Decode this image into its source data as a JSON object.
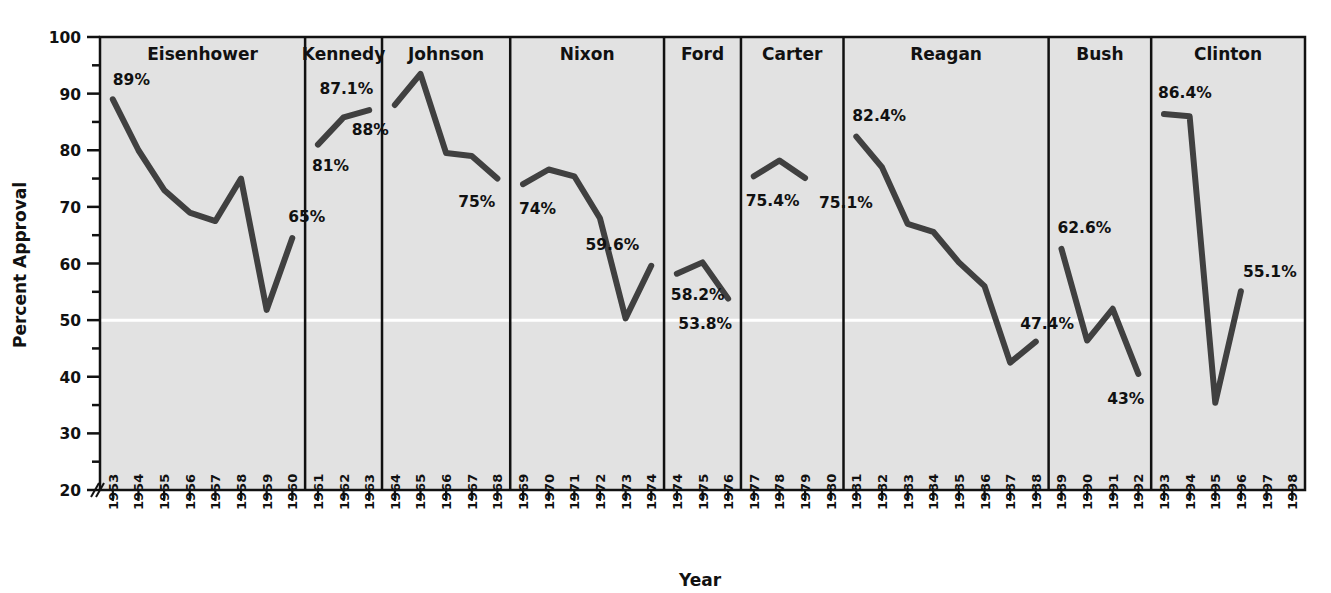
{
  "chart_data": {
    "type": "line",
    "title": "",
    "xlabel": "Year",
    "ylabel": "Percent Approval",
    "ylim": [
      20,
      100
    ],
    "yticks": [
      20,
      30,
      40,
      50,
      60,
      70,
      80,
      90,
      100
    ],
    "ytick_labels": [
      "20",
      "30",
      "40",
      "50",
      "60",
      "70",
      "80",
      "90",
      "100"
    ],
    "minor_tick_step": 5,
    "axis_break": true,
    "grid": false,
    "legend": "none",
    "reference_line": {
      "value": 50,
      "color": "#ffffff"
    },
    "plot_background": "#e2e2e2",
    "line_color": "#404040",
    "panels": [
      {
        "name": "Eisenhower",
        "years": [
          "1953",
          "1954",
          "1955",
          "1956",
          "1957",
          "1958",
          "1959",
          "1960"
        ],
        "values": [
          89.0,
          80.0,
          73.0,
          69.0,
          67.5,
          75.0,
          51.8,
          64.5
        ],
        "labels": [
          {
            "text": "89%",
            "year": "1953",
            "value": 89.0
          },
          {
            "text": "65%",
            "year": "1960",
            "value": 64.5
          }
        ]
      },
      {
        "name": "Kennedy",
        "years": [
          "1961",
          "1962",
          "1963"
        ],
        "values": [
          81.0,
          85.8,
          87.1
        ],
        "labels": [
          {
            "text": "87.1%",
            "year": "1963",
            "value": 87.1
          },
          {
            "text": "81%",
            "year": "1961",
            "value": 81.0
          }
        ]
      },
      {
        "name": "Johnson",
        "years": [
          "1964",
          "1965",
          "1966",
          "1967",
          "1968"
        ],
        "values": [
          88.0,
          93.5,
          79.5,
          79.0,
          75.0
        ],
        "labels": [
          {
            "text": "88%",
            "year": "1964",
            "value": 88.0
          },
          {
            "text": "75%",
            "year": "1968",
            "value": 75.0
          }
        ]
      },
      {
        "name": "Nixon",
        "years": [
          "1969",
          "1970",
          "1971",
          "1972",
          "1973",
          "1974"
        ],
        "values": [
          74.0,
          76.6,
          75.4,
          68.0,
          50.3,
          59.6
        ],
        "labels": [
          {
            "text": "74%",
            "year": "1969",
            "value": 74.0
          },
          {
            "text": "59.6%",
            "year": "1974",
            "value": 59.6
          }
        ]
      },
      {
        "name": "Ford",
        "years": [
          "1974",
          "1975",
          "1976"
        ],
        "values": [
          58.2,
          60.2,
          53.8
        ],
        "labels": [
          {
            "text": "58.2%",
            "year": "1974",
            "value": 58.2
          },
          {
            "text": "53.8%",
            "year": "1976",
            "value": 53.8
          }
        ]
      },
      {
        "name": "Carter",
        "years": [
          "1977",
          "1978",
          "1979",
          "1980"
        ],
        "values": [
          75.4,
          78.2,
          75.1
        ],
        "labels": [
          {
            "text": "75.4%",
            "year": "1977",
            "value": 75.4
          },
          {
            "text": "75.1%",
            "year": "1979",
            "value": 75.1
          }
        ]
      },
      {
        "name": "Reagan",
        "years": [
          "1981",
          "1982",
          "1983",
          "1984",
          "1985",
          "1986",
          "1987",
          "1988"
        ],
        "values": [
          82.4,
          77.0,
          67.0,
          65.6,
          60.2,
          56.0,
          42.5,
          46.2
        ],
        "labels": [
          {
            "text": "82.4%",
            "year": "1981",
            "value": 82.4
          },
          {
            "text": "47.4%",
            "year": "1987",
            "value": 47.4
          }
        ]
      },
      {
        "name": "Bush",
        "years": [
          "1989",
          "1990",
          "1991",
          "1992"
        ],
        "values": [
          62.6,
          46.4,
          52.0,
          40.5
        ],
        "labels": [
          {
            "text": "62.6%",
            "year": "1989",
            "value": 62.6
          },
          {
            "text": "43%",
            "year": "1992",
            "value": 40.5
          }
        ]
      },
      {
        "name": "Clinton",
        "years": [
          "1993",
          "1994",
          "1995",
          "1996",
          "1997",
          "1998"
        ],
        "values": [
          86.4,
          86.0,
          35.4,
          55.1
        ],
        "labels": [
          {
            "text": "86.4%",
            "year": "1993",
            "value": 86.4
          },
          {
            "text": "55.1%",
            "year": "1996",
            "value": 55.1
          }
        ]
      }
    ]
  },
  "axes": {
    "y_title": "Percent Approval",
    "x_title": "Year"
  }
}
